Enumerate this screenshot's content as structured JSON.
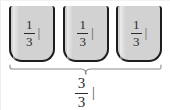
{
  "figure": {
    "colors": {
      "cup_fill": "#d2d2d2",
      "cup_border": "#1d1d1d",
      "brace": "#8c8c8c",
      "text": "#2b2b2b",
      "background": "#ffffff"
    }
  },
  "cups": [
    {
      "numerator": "1",
      "denominator": "3",
      "unit_mark": "|"
    },
    {
      "numerator": "1",
      "denominator": "3",
      "unit_mark": "|"
    },
    {
      "numerator": "1",
      "denominator": "3",
      "unit_mark": "|"
    }
  ],
  "total": {
    "numerator": "3",
    "denominator": "3",
    "unit_mark": "|"
  }
}
